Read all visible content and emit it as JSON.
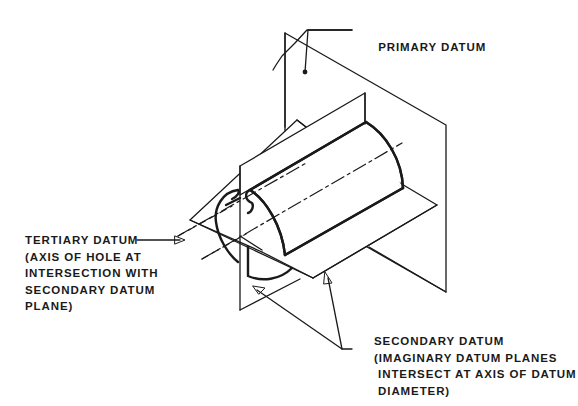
{
  "figure": {
    "type": "isometric datum reference frame illustration"
  },
  "labels": {
    "primary": {
      "line1": "PRIMARY DATUM"
    },
    "tertiary": {
      "line1": "TERTIARY DATUM",
      "line2": "(AXIS OF HOLE AT",
      "line3": "INTERSECTION WITH",
      "line4": "SECONDARY DATUM",
      "line5": "PLANE)"
    },
    "secondary": {
      "line1": "SECONDARY DATUM",
      "line2": "(IMAGINARY DATUM PLANES",
      "line3": " INTERSECT AT AXIS OF DATUM",
      "line4": " DIAMETER)"
    }
  },
  "colors": {
    "ink": "#1a1a1a",
    "paper": "#ffffff"
  }
}
